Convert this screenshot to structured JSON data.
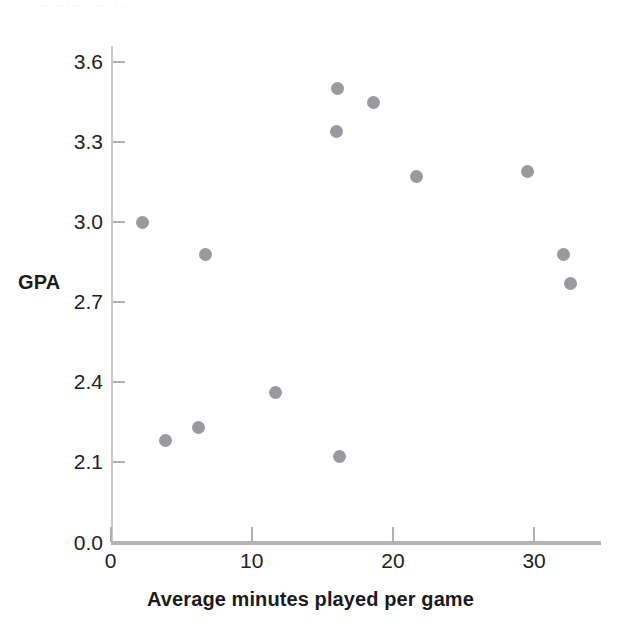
{
  "figure": {
    "bleed_text": "  ... ..  .   ..      ..  ..    .     .    .. ",
    "background_color": "#ffffff",
    "point_color": "#9a9a9e",
    "axis_color": "#b4b4b8"
  },
  "chart_data": {
    "type": "scatter",
    "title": "",
    "xlabel": "Average minutes played per game",
    "ylabel": "GPA",
    "xlim": [
      0,
      35
    ],
    "ylim": [
      0,
      3.75
    ],
    "grid": false,
    "legend": null,
    "y_axis_broken": true,
    "y_break_note": "axis jumps from 0.0 to 2.1",
    "xticks": [
      0,
      10,
      20,
      30
    ],
    "xticklabels": [
      "0",
      "10",
      "20",
      "30"
    ],
    "yticks": [
      0.0,
      2.1,
      2.4,
      2.7,
      3.0,
      3.3,
      3.6
    ],
    "yticklabels": [
      "0.0",
      "2.1",
      "2.4",
      "2.7",
      "3.0",
      "3.3",
      "3.6"
    ],
    "points": [
      {
        "x": 2.3,
        "y": 3.0
      },
      {
        "x": 3.9,
        "y": 2.18
      },
      {
        "x": 6.2,
        "y": 2.23
      },
      {
        "x": 6.7,
        "y": 2.88
      },
      {
        "x": 11.7,
        "y": 2.36
      },
      {
        "x": 16.0,
        "y": 3.34
      },
      {
        "x": 16.1,
        "y": 3.5
      },
      {
        "x": 16.2,
        "y": 2.12
      },
      {
        "x": 18.6,
        "y": 3.45
      },
      {
        "x": 21.7,
        "y": 3.17
      },
      {
        "x": 29.5,
        "y": 3.19
      },
      {
        "x": 32.1,
        "y": 2.88
      },
      {
        "x": 32.6,
        "y": 2.77
      }
    ]
  }
}
